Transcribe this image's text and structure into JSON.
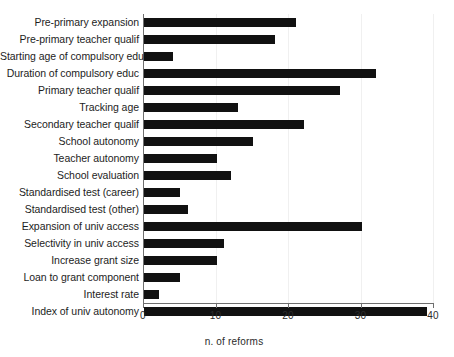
{
  "chart_data": {
    "type": "bar",
    "orientation": "horizontal",
    "title": "",
    "subtitle": "",
    "xlabel": "n. of reforms",
    "ylabel": "",
    "xlim": [
      0,
      40
    ],
    "xticks": [
      0,
      10,
      20,
      30,
      40
    ],
    "xtick_labels": [
      "0",
      "10",
      "20",
      "30",
      "40"
    ],
    "grid": "vertical-faint",
    "legend": "none",
    "bar_color": "#111111",
    "axis_color": "#6f6f6f",
    "categories": [
      "Pre-primary expansion",
      "Pre-primary teacher qualif",
      "Starting age of compulsory educ",
      "Duration of compulsory educ",
      "Primary teacher qualif",
      "Tracking age",
      "Secondary teacher qualif",
      "School autonomy",
      "Teacher autonomy",
      "School evaluation",
      "Standardised test (career)",
      "Standardised test (other)",
      "Expansion of univ access",
      "Selectivity in univ access",
      "Increase grant size",
      "Loan to grant component",
      "Interest rate",
      "Index of univ autonomy"
    ],
    "values": [
      21,
      18,
      4,
      32,
      27,
      13,
      22,
      15,
      10,
      12,
      5,
      6,
      30,
      11,
      10,
      5,
      2,
      39
    ]
  }
}
